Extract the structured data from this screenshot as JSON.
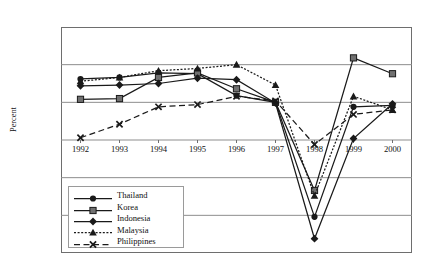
{
  "figure": {
    "title": "Figure 1: Adjustment of Real GDP Growth Rate in East Asia"
  },
  "chart_data": {
    "type": "line",
    "title": "Figure 1: Adjustment of Real GDP Growth Rate in East Asia",
    "xlabel": "",
    "ylabel": "Percent",
    "categories": [
      "1992",
      "1993",
      "1994",
      "1995",
      "1996",
      "1997",
      "1998",
      "1999",
      "2000"
    ],
    "x": [
      1992,
      1993,
      1994,
      1995,
      1996,
      1997,
      1998,
      1999,
      2000
    ],
    "ylim": [
      -15.0,
      15.0
    ],
    "yticks": [
      15.0,
      10.0,
      5.0,
      0.0,
      -5.0,
      -10.0,
      -15.0
    ],
    "ytick_labels": [
      "15.0",
      "10.0",
      "5.0",
      "0.0",
      "-5.0",
      "-10.0",
      "-15.0"
    ],
    "grid": true,
    "legend_position": "lower-left-inside",
    "series": [
      {
        "name": "Thailand",
        "marker": "filled-circle",
        "line_style": "solid",
        "color": "#1a1a1a",
        "values": [
          8.1,
          8.3,
          8.9,
          8.8,
          5.9,
          5.0,
          -10.2,
          4.4,
          4.6
        ]
      },
      {
        "name": "Korea",
        "marker": "filled-square",
        "line_style": "solid",
        "color": "#1a1a1a",
        "values": [
          5.4,
          5.5,
          8.3,
          8.9,
          6.8,
          5.0,
          -6.7,
          10.9,
          8.8
        ]
      },
      {
        "name": "Indonesia",
        "marker": "filled-diamond",
        "line_style": "solid",
        "color": "#1a1a1a",
        "values": [
          7.2,
          7.3,
          7.5,
          8.2,
          8.0,
          4.9,
          -13.1,
          0.2,
          4.8
        ]
      },
      {
        "name": "Malaysia",
        "marker": "filled-triangle",
        "line_style": "dotted",
        "color": "#1a1a1a",
        "values": [
          7.8,
          8.3,
          9.2,
          9.5,
          10.0,
          7.3,
          -7.4,
          5.8,
          4.0
        ]
      },
      {
        "name": "Philippines",
        "marker": "cross-x",
        "line_style": "dashed",
        "color": "#1a1a1a",
        "values": [
          0.3,
          2.1,
          4.4,
          4.7,
          5.8,
          5.2,
          -0.6,
          3.4,
          4.0
        ]
      }
    ]
  }
}
